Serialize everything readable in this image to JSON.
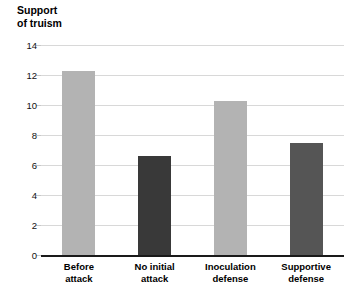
{
  "chart_data": {
    "type": "bar",
    "title": "Support\nof truism",
    "xlabel": "",
    "ylabel": "Support of truism",
    "categories": [
      "Before\nattack",
      "No initial\nattack",
      "Inoculation\ndefense",
      "Supportive\ndefense"
    ],
    "category_labels_flat": [
      "Before attack",
      "No initial attack",
      "Inoculation defense",
      "Supportive defense"
    ],
    "values": [
      12.3,
      6.6,
      10.3,
      7.5
    ],
    "bar_colors": [
      "#b3b3b3",
      "#393939",
      "#b3b3b3",
      "#555555"
    ],
    "ylim": [
      0,
      14
    ],
    "yticks": [
      0,
      2,
      4,
      6,
      8,
      10,
      12,
      14
    ],
    "ytick_labels": [
      "0",
      "2",
      "4",
      "6",
      "8",
      "10",
      "12",
      "14"
    ],
    "grid": true,
    "grid_color": "#d8d8d8",
    "legend": null,
    "axis_color": "#1a1a1a",
    "background": "#ffffff"
  }
}
